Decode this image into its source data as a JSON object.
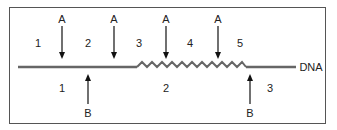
{
  "diagram": {
    "dna_label": "DNA",
    "top_arrows": [
      {
        "label": "A",
        "x": 62
      },
      {
        "label": "A",
        "x": 114
      },
      {
        "label": "A",
        "x": 166
      },
      {
        "label": "A",
        "x": 218
      }
    ],
    "bottom_arrows": [
      {
        "label": "B",
        "x": 88
      },
      {
        "label": "B",
        "x": 250
      }
    ],
    "top_regions": [
      {
        "label": "1",
        "x": 38
      },
      {
        "label": "2",
        "x": 88
      },
      {
        "label": "3",
        "x": 139
      },
      {
        "label": "4",
        "x": 190
      },
      {
        "label": "5",
        "x": 240
      }
    ],
    "bottom_regions": [
      {
        "label": "1",
        "x": 62
      },
      {
        "label": "2",
        "x": 166
      },
      {
        "label": "3",
        "x": 270
      }
    ],
    "colors": {
      "dna_line": "#666666",
      "arrow": "#111111",
      "border": "#555555"
    }
  }
}
